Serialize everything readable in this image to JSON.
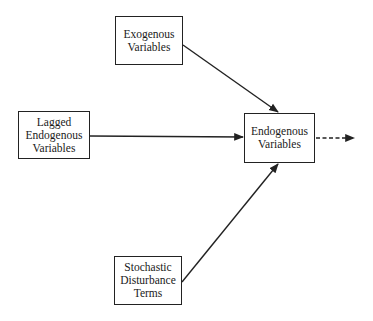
{
  "diagram": {
    "type": "flow",
    "nodes": [
      {
        "id": "exogenous",
        "lines": [
          "Exogenous",
          "Variables"
        ]
      },
      {
        "id": "lagged",
        "lines": [
          "Lagged",
          "Endogenous",
          "Variables"
        ]
      },
      {
        "id": "endogenous",
        "lines": [
          "Endogenous",
          "Variables"
        ]
      },
      {
        "id": "stochastic",
        "lines": [
          "Stochastic",
          "Disturbance",
          "Terms"
        ]
      }
    ],
    "edges": [
      {
        "from": "exogenous",
        "to": "endogenous",
        "style": "solid"
      },
      {
        "from": "lagged",
        "to": "endogenous",
        "style": "solid"
      },
      {
        "from": "stochastic",
        "to": "endogenous",
        "style": "solid"
      },
      {
        "from": "endogenous",
        "to": "output",
        "style": "dashed"
      }
    ],
    "colors": {
      "stroke": "#222222",
      "background": "#ffffff"
    }
  }
}
